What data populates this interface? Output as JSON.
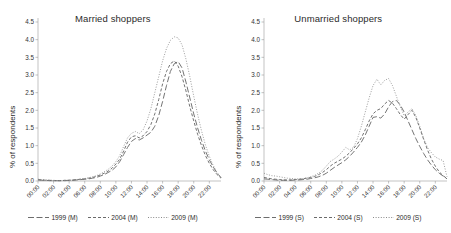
{
  "figure": {
    "ylabel": "% of respondents"
  },
  "chart_data": [
    {
      "type": "line",
      "title": "Married shoppers",
      "xlabel": "",
      "ylabel": "% of respondents",
      "ylim": [
        0,
        4.5
      ],
      "yticks": [
        "0.0",
        "0.5",
        "1.0",
        "1.5",
        "2.0",
        "2.5",
        "3.0",
        "3.5",
        "4.0",
        "4.5"
      ],
      "grid": false,
      "legend_position": "bottom",
      "x": [
        "00:00",
        "02:00",
        "04:00",
        "06:00",
        "08:00",
        "10:00",
        "12:00",
        "14:00",
        "16:00",
        "18:00",
        "20:00",
        "22:00"
      ],
      "xticks": [
        "00:00",
        "02:00",
        "04:00",
        "06:00",
        "08:00",
        "10:00",
        "12:00",
        "14:00",
        "16:00",
        "18:00",
        "20:00",
        "22:00"
      ],
      "x_hours": [
        0,
        0.5,
        1,
        1.5,
        2,
        2.5,
        3,
        3.5,
        4,
        4.5,
        5,
        5.5,
        6,
        6.5,
        7,
        7.5,
        8,
        8.5,
        9,
        9.5,
        10,
        10.5,
        11,
        11.5,
        12,
        12.5,
        13,
        13.5,
        14,
        14.5,
        15,
        15.5,
        16,
        16.5,
        17,
        17.5,
        18,
        18.5,
        19,
        19.5,
        20,
        20.5,
        21,
        21.5,
        22,
        22.5,
        23,
        23.5
      ],
      "series": [
        {
          "name": "1999 (M)",
          "style": "long-dash",
          "values": [
            0.03,
            0.02,
            0.02,
            0.01,
            0.01,
            0.01,
            0.01,
            0.01,
            0.02,
            0.02,
            0.03,
            0.04,
            0.05,
            0.06,
            0.08,
            0.1,
            0.14,
            0.18,
            0.24,
            0.3,
            0.4,
            0.55,
            0.75,
            0.95,
            1.12,
            1.2,
            1.16,
            1.22,
            1.3,
            1.38,
            1.55,
            1.85,
            2.25,
            2.7,
            3.1,
            3.32,
            3.38,
            3.2,
            2.8,
            2.35,
            1.9,
            1.5,
            1.15,
            0.85,
            0.6,
            0.4,
            0.22,
            0.1
          ]
        },
        {
          "name": "2004 (M)",
          "style": "dash",
          "values": [
            0.04,
            0.03,
            0.02,
            0.02,
            0.01,
            0.01,
            0.01,
            0.02,
            0.02,
            0.03,
            0.04,
            0.05,
            0.06,
            0.08,
            0.1,
            0.13,
            0.17,
            0.22,
            0.28,
            0.36,
            0.48,
            0.62,
            0.85,
            1.1,
            1.25,
            1.28,
            1.22,
            1.28,
            1.4,
            1.6,
            1.9,
            2.3,
            2.75,
            3.1,
            3.32,
            3.4,
            3.25,
            2.95,
            2.55,
            2.1,
            1.7,
            1.32,
            1.0,
            0.72,
            0.5,
            0.32,
            0.18,
            0.08
          ]
        },
        {
          "name": "2009 (M)",
          "style": "dot",
          "values": [
            0.05,
            0.04,
            0.03,
            0.02,
            0.02,
            0.01,
            0.01,
            0.02,
            0.02,
            0.03,
            0.04,
            0.06,
            0.07,
            0.09,
            0.12,
            0.15,
            0.2,
            0.26,
            0.33,
            0.42,
            0.55,
            0.72,
            0.98,
            1.22,
            1.35,
            1.4,
            1.34,
            1.45,
            1.7,
            2.05,
            2.5,
            2.95,
            3.4,
            3.75,
            3.98,
            4.08,
            4.05,
            3.85,
            3.45,
            2.95,
            2.4,
            1.88,
            1.42,
            1.02,
            0.7,
            0.44,
            0.24,
            0.1
          ]
        }
      ]
    },
    {
      "type": "line",
      "title": "Unmarried shoppers",
      "xlabel": "",
      "ylabel": "% of respondents",
      "ylim": [
        0,
        4.5
      ],
      "yticks": [
        "0.0",
        "0.5",
        "1.0",
        "1.5",
        "2.0",
        "2.5",
        "3.0",
        "3.5",
        "4.0",
        "4.5"
      ],
      "grid": false,
      "legend_position": "bottom",
      "x": [
        "00:00",
        "02:00",
        "04:00",
        "06:00",
        "08:00",
        "10:00",
        "12:00",
        "14:00",
        "16:00",
        "18:00",
        "20:00",
        "22:00"
      ],
      "xticks": [
        "00:00",
        "02:00",
        "04:00",
        "06:00",
        "08:00",
        "10:00",
        "12:00",
        "14:00",
        "16:00",
        "18:00",
        "20:00",
        "22:00"
      ],
      "x_hours": [
        0,
        0.5,
        1,
        1.5,
        2,
        2.5,
        3,
        3.5,
        4,
        4.5,
        5,
        5.5,
        6,
        6.5,
        7,
        7.5,
        8,
        8.5,
        9,
        9.5,
        10,
        10.5,
        11,
        11.5,
        12,
        12.5,
        13,
        13.5,
        14,
        14.5,
        15,
        15.5,
        16,
        16.5,
        17,
        17.5,
        18,
        18.5,
        19,
        19.5,
        20,
        20.5,
        21,
        21.5,
        22,
        22.5,
        23,
        23.5
      ],
      "series": [
        {
          "name": "1999 (S)",
          "style": "long-dash",
          "values": [
            0.06,
            0.05,
            0.04,
            0.03,
            0.02,
            0.02,
            0.02,
            0.02,
            0.03,
            0.03,
            0.04,
            0.05,
            0.07,
            0.09,
            0.12,
            0.16,
            0.22,
            0.3,
            0.38,
            0.45,
            0.52,
            0.6,
            0.7,
            0.82,
            0.95,
            1.1,
            1.3,
            1.55,
            1.8,
            1.82,
            1.78,
            1.9,
            2.1,
            2.25,
            2.28,
            2.15,
            1.95,
            1.7,
            1.45,
            1.2,
            0.98,
            0.78,
            0.6,
            0.45,
            0.32,
            0.22,
            0.14,
            0.06
          ]
        },
        {
          "name": "2004 (S)",
          "style": "dash",
          "values": [
            0.1,
            0.08,
            0.06,
            0.05,
            0.04,
            0.03,
            0.03,
            0.03,
            0.04,
            0.05,
            0.06,
            0.08,
            0.1,
            0.13,
            0.18,
            0.24,
            0.32,
            0.42,
            0.5,
            0.56,
            0.62,
            0.7,
            0.8,
            0.92,
            1.05,
            1.22,
            1.45,
            1.7,
            1.9,
            2.0,
            2.05,
            2.18,
            2.28,
            2.2,
            2.05,
            1.88,
            1.75,
            1.88,
            2.0,
            1.8,
            1.5,
            1.18,
            0.88,
            0.62,
            0.42,
            0.26,
            0.15,
            0.07
          ]
        },
        {
          "name": "2009 (S)",
          "style": "dot",
          "values": [
            0.22,
            0.18,
            0.15,
            0.14,
            0.12,
            0.1,
            0.08,
            0.07,
            0.06,
            0.06,
            0.07,
            0.09,
            0.12,
            0.16,
            0.22,
            0.3,
            0.42,
            0.55,
            0.62,
            0.7,
            0.82,
            0.95,
            0.88,
            0.95,
            1.2,
            1.55,
            1.95,
            2.35,
            2.7,
            2.88,
            2.72,
            2.85,
            2.9,
            2.7,
            2.4,
            2.1,
            1.85,
            1.95,
            2.05,
            1.85,
            1.55,
            1.2,
            0.95,
            0.8,
            0.68,
            0.62,
            0.58,
            0.12
          ]
        }
      ]
    }
  ]
}
